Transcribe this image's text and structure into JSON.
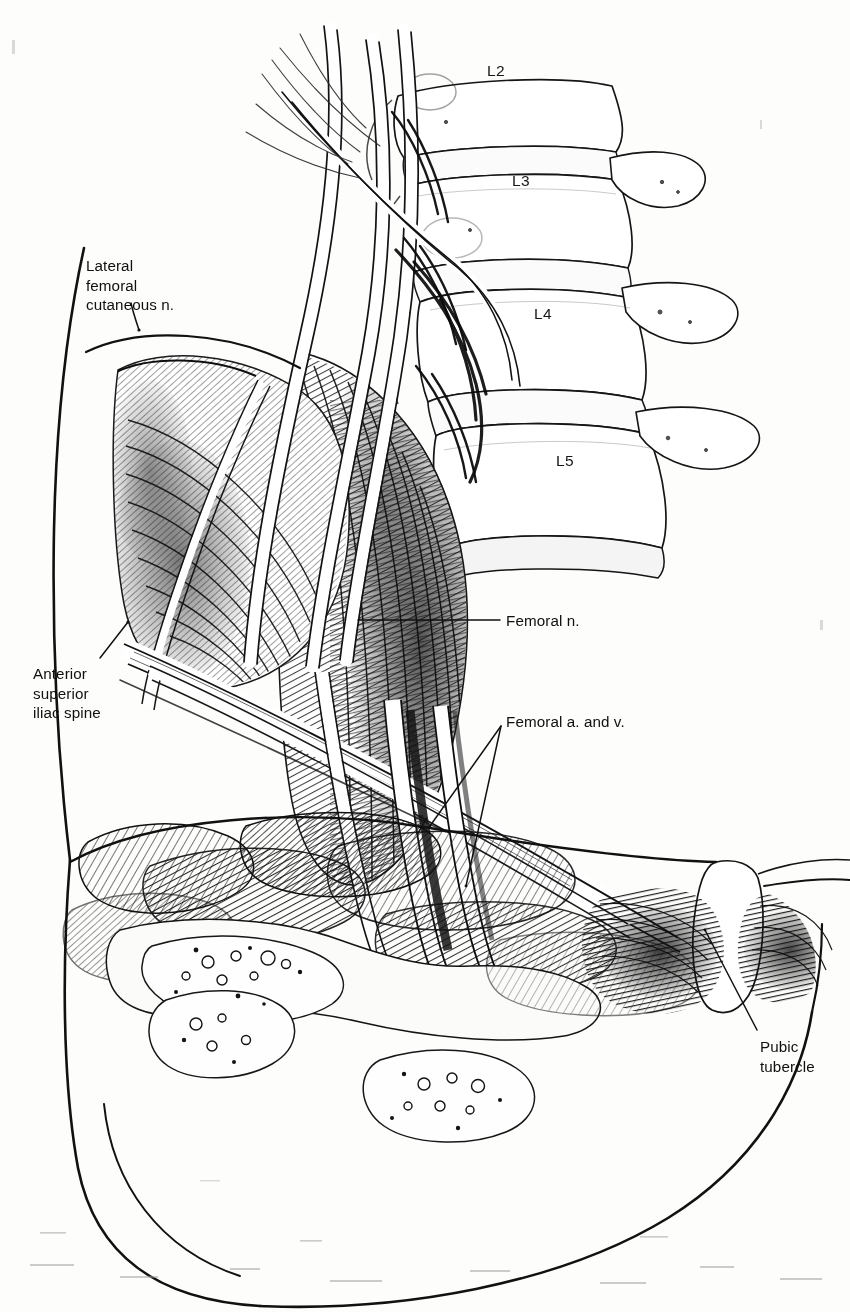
{
  "figure": {
    "kind": "anatomical-line-drawing",
    "background_color": "#fdfdfc",
    "ink_color": "#111111",
    "width": 850,
    "height": 1312
  },
  "vertebrae": [
    {
      "label": "L2",
      "x": 487,
      "y": 62
    },
    {
      "label": "L3",
      "x": 512,
      "y": 172
    },
    {
      "label": "L4",
      "x": 534,
      "y": 305
    },
    {
      "label": "L5",
      "x": 556,
      "y": 452
    }
  ],
  "labels": [
    {
      "name": "lateral-femoral-cutaneous-nerve",
      "text": "Lateral\nfemoral\ncutaneous n.",
      "x": 86,
      "y": 256,
      "align": "left"
    },
    {
      "name": "anterior-superior-iliac-spine",
      "text": "Anterior\nsuperior\niliac spine",
      "x": 33,
      "y": 664,
      "align": "left"
    },
    {
      "name": "femoral-nerve",
      "text": "Femoral n.",
      "x": 506,
      "y": 611,
      "align": "left"
    },
    {
      "name": "femoral-artery-and-vein",
      "text": "Femoral a. and v.",
      "x": 506,
      "y": 712,
      "align": "left"
    },
    {
      "name": "pubic-tubercle",
      "text": "Pubic\ntubercle",
      "x": 760,
      "y": 1037,
      "align": "left"
    }
  ],
  "leader_lines": [
    {
      "name": "leader-lateral-femoral-cutaneous",
      "points": "139,330 131,305"
    },
    {
      "name": "leader-anterior-superior-iliac-spine",
      "points": "128,622 100,658"
    },
    {
      "name": "leader-femoral-nerve",
      "points": "358,620 500,620"
    },
    {
      "name": "leader-femoral-artery",
      "points": "501,726 430,826"
    },
    {
      "name": "leader-femoral-vein",
      "points": "501,726 466,886"
    },
    {
      "name": "leader-pubic-tubercle",
      "points": "757,1030 705,930"
    }
  ]
}
